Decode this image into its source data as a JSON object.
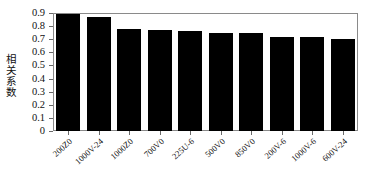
{
  "chart_data": {
    "type": "bar",
    "title": "",
    "xlabel": "",
    "ylabel": "相关系数",
    "categories": [
      "200Z0",
      "1000V-24",
      "1000Z0",
      "700V0",
      "225U-6",
      "500V0",
      "850V0",
      "200V-6",
      "1000V-6",
      "600V-24"
    ],
    "values": [
      0.89,
      0.87,
      0.78,
      0.77,
      0.76,
      0.75,
      0.75,
      0.72,
      0.72,
      0.705
    ],
    "ylim": [
      0,
      0.9
    ],
    "ytick_labels": [
      "0.9",
      "0.8",
      "0.7",
      "0.6",
      "0.5",
      "0.4",
      "0.3",
      "0.2",
      "0.1",
      "0"
    ],
    "ytick_values": [
      0.9,
      0.8,
      0.7,
      0.6,
      0.5,
      0.4,
      0.3,
      0.2,
      0.1,
      0
    ],
    "grid": false,
    "legend": null,
    "bar_color": "#000000",
    "axis_color": "#8a8a8a",
    "background": "#ffffff"
  }
}
